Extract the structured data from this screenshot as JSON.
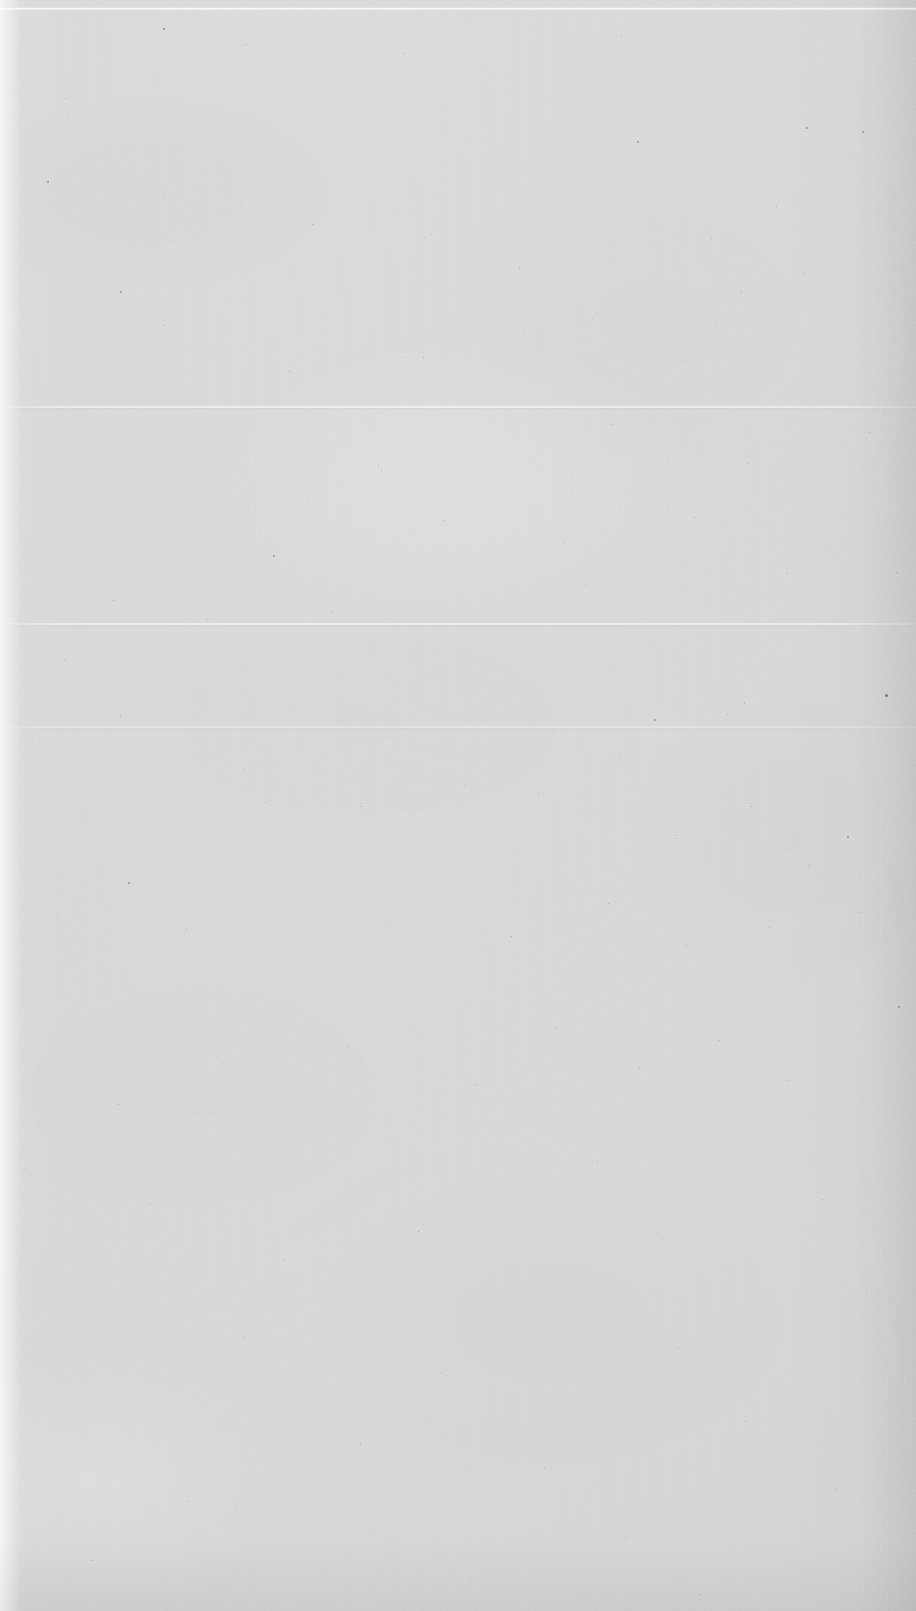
{
  "document": {
    "kind": "scanned-page",
    "page_label": "",
    "content_text": "",
    "has_visible_text": false,
    "description": "Blank scanned sheet of paper with fiber texture, scattered dust specks and horizontal fold creases.",
    "width_px": 916,
    "height_px": 1611
  },
  "appearance": {
    "paper_color": "#f2f2f2",
    "paper_color_light": "#f7f7f7",
    "paper_color_dark": "#e9e9e9",
    "speck_color": "#6e6e6e",
    "crease_highlight": "#ffffff",
    "crease_shadow": "#000000"
  },
  "creases": [
    {
      "name": "fold-line-upper",
      "y_px": 406,
      "strength": "soft"
    },
    {
      "name": "fold-line-middle",
      "y_px": 623,
      "strength": "soft"
    },
    {
      "name": "fold-line-lower",
      "y_px": 726,
      "strength": "faint"
    }
  ],
  "specks": [
    {
      "x": 163,
      "y": 28,
      "s": 2
    },
    {
      "x": 246,
      "y": 44,
      "s": 1
    },
    {
      "x": 404,
      "y": 53,
      "s": 1
    },
    {
      "x": 621,
      "y": 35,
      "s": 1
    },
    {
      "x": 806,
      "y": 127,
      "s": 2
    },
    {
      "x": 862,
      "y": 131,
      "s": 2
    },
    {
      "x": 637,
      "y": 141,
      "s": 2
    },
    {
      "x": 47,
      "y": 181,
      "s": 2
    },
    {
      "x": 65,
      "y": 98,
      "s": 1
    },
    {
      "x": 120,
      "y": 291,
      "s": 2
    },
    {
      "x": 312,
      "y": 224,
      "s": 1
    },
    {
      "x": 431,
      "y": 234,
      "s": 1
    },
    {
      "x": 519,
      "y": 268,
      "s": 1
    },
    {
      "x": 711,
      "y": 238,
      "s": 1
    },
    {
      "x": 776,
      "y": 206,
      "s": 1
    },
    {
      "x": 803,
      "y": 273,
      "s": 1
    },
    {
      "x": 741,
      "y": 292,
      "s": 1
    },
    {
      "x": 592,
      "y": 318,
      "s": 1
    },
    {
      "x": 423,
      "y": 357,
      "s": 1
    },
    {
      "x": 289,
      "y": 371,
      "s": 1
    },
    {
      "x": 163,
      "y": 325,
      "s": 1
    },
    {
      "x": 869,
      "y": 432,
      "s": 1
    },
    {
      "x": 612,
      "y": 424,
      "s": 1
    },
    {
      "x": 748,
      "y": 463,
      "s": 1
    },
    {
      "x": 381,
      "y": 470,
      "s": 1
    },
    {
      "x": 443,
      "y": 520,
      "s": 1
    },
    {
      "x": 273,
      "y": 555,
      "s": 2
    },
    {
      "x": 563,
      "y": 542,
      "s": 1
    },
    {
      "x": 695,
      "y": 517,
      "s": 1
    },
    {
      "x": 585,
      "y": 585,
      "s": 1
    },
    {
      "x": 786,
      "y": 573,
      "s": 1
    },
    {
      "x": 896,
      "y": 572,
      "s": 1
    },
    {
      "x": 113,
      "y": 600,
      "s": 1
    },
    {
      "x": 206,
      "y": 619,
      "s": 1
    },
    {
      "x": 331,
      "y": 611,
      "s": 1
    },
    {
      "x": 64,
      "y": 659,
      "s": 1
    },
    {
      "x": 885,
      "y": 694,
      "s": 3
    },
    {
      "x": 654,
      "y": 719,
      "s": 2
    },
    {
      "x": 727,
      "y": 714,
      "s": 1
    },
    {
      "x": 744,
      "y": 703,
      "s": 1
    },
    {
      "x": 120,
      "y": 715,
      "s": 1
    },
    {
      "x": 244,
      "y": 770,
      "s": 1
    },
    {
      "x": 38,
      "y": 742,
      "s": 1
    },
    {
      "x": 266,
      "y": 802,
      "s": 1
    },
    {
      "x": 361,
      "y": 806,
      "s": 1
    },
    {
      "x": 464,
      "y": 785,
      "s": 1
    },
    {
      "x": 538,
      "y": 793,
      "s": 1
    },
    {
      "x": 606,
      "y": 762,
      "s": 1
    },
    {
      "x": 676,
      "y": 838,
      "s": 1
    },
    {
      "x": 751,
      "y": 806,
      "s": 1
    },
    {
      "x": 847,
      "y": 836,
      "s": 2
    },
    {
      "x": 808,
      "y": 865,
      "s": 1
    },
    {
      "x": 128,
      "y": 882,
      "s": 2
    },
    {
      "x": 57,
      "y": 918,
      "s": 1
    },
    {
      "x": 186,
      "y": 929,
      "s": 1
    },
    {
      "x": 389,
      "y": 922,
      "s": 1
    },
    {
      "x": 511,
      "y": 936,
      "s": 1
    },
    {
      "x": 608,
      "y": 903,
      "s": 1
    },
    {
      "x": 686,
      "y": 945,
      "s": 1
    },
    {
      "x": 769,
      "y": 927,
      "s": 1
    },
    {
      "x": 858,
      "y": 912,
      "s": 1
    },
    {
      "x": 898,
      "y": 1006,
      "s": 2
    },
    {
      "x": 30,
      "y": 1174,
      "s": 1
    },
    {
      "x": 118,
      "y": 1104,
      "s": 1
    },
    {
      "x": 222,
      "y": 1062,
      "s": 1
    },
    {
      "x": 347,
      "y": 1046,
      "s": 1
    },
    {
      "x": 474,
      "y": 1084,
      "s": 1
    },
    {
      "x": 556,
      "y": 1028,
      "s": 1
    },
    {
      "x": 639,
      "y": 1067,
      "s": 1
    },
    {
      "x": 719,
      "y": 1040,
      "s": 1
    },
    {
      "x": 789,
      "y": 1080,
      "s": 1
    },
    {
      "x": 150,
      "y": 1203,
      "s": 1
    },
    {
      "x": 284,
      "y": 1259,
      "s": 1
    },
    {
      "x": 418,
      "y": 1231,
      "s": 1
    },
    {
      "x": 597,
      "y": 1161,
      "s": 1
    },
    {
      "x": 662,
      "y": 1238,
      "s": 1
    },
    {
      "x": 822,
      "y": 1199,
      "s": 1
    },
    {
      "x": 866,
      "y": 1290,
      "s": 1
    },
    {
      "x": 244,
      "y": 1337,
      "s": 1
    },
    {
      "x": 441,
      "y": 1372,
      "s": 1
    },
    {
      "x": 678,
      "y": 1347,
      "s": 1
    },
    {
      "x": 360,
      "y": 1443,
      "s": 1
    },
    {
      "x": 544,
      "y": 1468,
      "s": 1
    },
    {
      "x": 745,
      "y": 1421,
      "s": 1
    },
    {
      "x": 186,
      "y": 1501,
      "s": 1
    },
    {
      "x": 626,
      "y": 1537,
      "s": 1
    },
    {
      "x": 836,
      "y": 1489,
      "s": 1
    },
    {
      "x": 470,
      "y": 1578,
      "s": 1
    },
    {
      "x": 700,
      "y": 1594,
      "s": 1
    },
    {
      "x": 92,
      "y": 1560,
      "s": 1
    }
  ]
}
